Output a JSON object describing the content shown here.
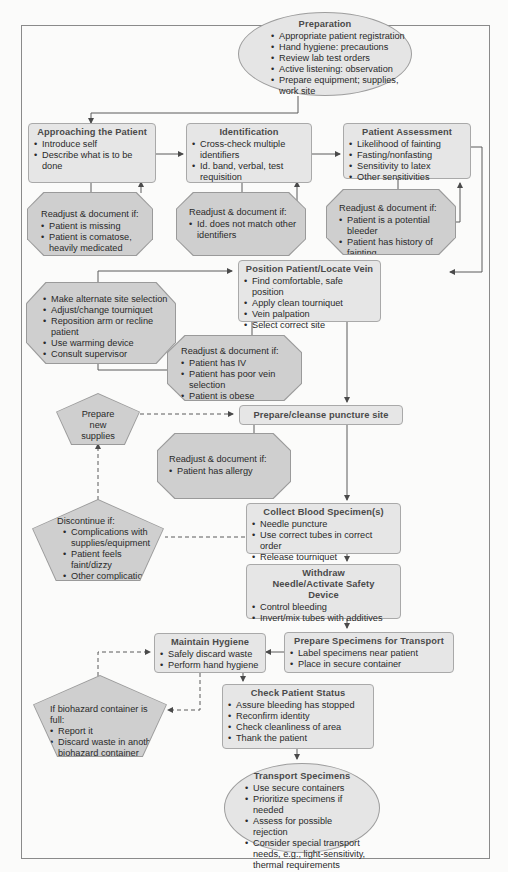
{
  "colors": {
    "box_fill": "#e6e6e6",
    "octagon_fill": "#cfcfcf",
    "line": "#5a5a5a",
    "title_text": "#4a4a4a"
  },
  "preparation": {
    "title": "Preparation",
    "items": [
      "Appropriate patient registration",
      "Hand hygiene: precautions",
      "Review lab test orders",
      "Active listening: observation",
      "Prepare equipment; supplies, work site"
    ]
  },
  "approaching": {
    "title": "Approaching the Patient",
    "items": [
      "Introduce self",
      "Describe what is to be done"
    ],
    "readjust": {
      "head": "Readjust & document if:",
      "items": [
        "Patient is missing",
        "Patient is comatose, heavily medicated"
      ]
    }
  },
  "identification": {
    "title": "Identification",
    "items": [
      "Cross-check multiple identifiers",
      "Id. band, verbal, test requisition"
    ],
    "readjust": {
      "head": "Readjust & document if:",
      "items": [
        "Id. does not match other identifiers"
      ]
    }
  },
  "assessment": {
    "title": "Patient Assessment",
    "items": [
      "Likelihood of fainting",
      "Fasting/nonfasting",
      "Sensitivity to latex",
      "Other sensitivities"
    ],
    "readjust": {
      "head": "Readjust & document if:",
      "items": [
        "Patient is a potential bleeder",
        "Patient has history of fainting"
      ]
    }
  },
  "position": {
    "title": "Position Patient/Locate Vein",
    "items": [
      "Find comfortable, safe position",
      "Apply clean tourniquet",
      "Vein palpation",
      "Select correct site"
    ],
    "alternatives": {
      "items": [
        "Make alternate site selection",
        "Adjust/change tourniquet",
        "Reposition arm or recline patient",
        "Use warming device",
        "Consult supervisor"
      ]
    },
    "readjust": {
      "head": "Readjust & document if:",
      "items": [
        "Patient has IV",
        "Patient has poor vein selection",
        "Patient is obese"
      ]
    }
  },
  "prepare_new_supplies": {
    "label": "Prepare new supplies"
  },
  "cleanse": {
    "title": "Prepare/cleanse puncture site",
    "readjust": {
      "head": "Readjust & document if:",
      "items": [
        "Patient has allergy"
      ]
    }
  },
  "discontinue": {
    "head": "Discontinue if:",
    "items": [
      "Complications with supplies/equipment",
      "Patient feels faint/dizzy",
      "Other complications"
    ]
  },
  "collect": {
    "title": "Collect Blood Specimen(s)",
    "items": [
      "Needle puncture",
      "Use correct tubes in correct order",
      "Release tourniquet"
    ]
  },
  "withdraw": {
    "title": "Withdraw Needle/Activate Safety Device",
    "items": [
      "Control bleeding",
      "Invert/mix tubes with additives"
    ]
  },
  "hygiene": {
    "title": "Maintain Hygiene",
    "items": [
      "Safely discard waste",
      "Perform hand hygiene"
    ]
  },
  "prepare_transport": {
    "title": "Prepare Specimens for Transport",
    "items": [
      "Label specimens near patient",
      "Place in secure container"
    ]
  },
  "biohazard": {
    "head": "If biohazard container is full:",
    "items": [
      "Report it",
      "Discard waste in another biohazard container"
    ]
  },
  "check_status": {
    "title": "Check Patient Status",
    "items": [
      "Assure bleeding has stopped",
      "Reconfirm identity",
      "Check cleanliness of area",
      "Thank the patient"
    ]
  },
  "transport": {
    "title": "Transport Specimens",
    "items": [
      "Use secure containers",
      "Prioritize specimens if needed",
      "Assess for possible rejection",
      "Consider special transport needs, e.g., light-sensitivity, thermal requirements"
    ]
  }
}
